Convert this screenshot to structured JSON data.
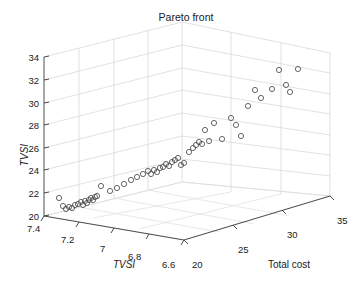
{
  "figure": {
    "title": "Pareto front",
    "background_color": "#ffffff",
    "marker_color": "#4d4d4d",
    "grid_color": "#d4d4d4",
    "axis_color": "#3a3a3a"
  },
  "chart_data": {
    "type": "scatter",
    "projection": "3d",
    "title": "Pareto front",
    "xlabel": "TVSI",
    "ylabel": "Total cost",
    "zlabel": "TVSI",
    "grid": true,
    "legend": null,
    "xlim": [
      7.4,
      6.6
    ],
    "ylim": [
      20,
      35
    ],
    "zlim": [
      20,
      34
    ],
    "xticks": [
      "7.4",
      "7.2",
      "7",
      "6.8",
      "6.6"
    ],
    "xtick_values": [
      7.4,
      7.2,
      7.0,
      6.8,
      6.6
    ],
    "yticks": [
      "20",
      "25",
      "30",
      "35"
    ],
    "ytick_values": [
      20,
      25,
      30,
      35
    ],
    "zticks": [
      "20",
      "22",
      "24",
      "26",
      "28",
      "30",
      "32",
      "34"
    ],
    "ztick_values": [
      20,
      22,
      24,
      26,
      28,
      30,
      32,
      34
    ],
    "n_points": 55,
    "marker": "circle-open",
    "points": [
      {
        "x": 7.37,
        "y": 20.3,
        "z": 21.8
      },
      {
        "x": 7.33,
        "y": 20.4,
        "z": 21.4
      },
      {
        "x": 7.32,
        "y": 20.5,
        "z": 21.0
      },
      {
        "x": 7.3,
        "y": 20.5,
        "z": 21.3
      },
      {
        "x": 7.29,
        "y": 20.6,
        "z": 21.2
      },
      {
        "x": 7.28,
        "y": 20.6,
        "z": 21.5
      },
      {
        "x": 7.27,
        "y": 20.7,
        "z": 21.7
      },
      {
        "x": 7.26,
        "y": 20.8,
        "z": 21.9
      },
      {
        "x": 7.25,
        "y": 20.8,
        "z": 21.6
      },
      {
        "x": 7.24,
        "y": 20.9,
        "z": 22.0
      },
      {
        "x": 7.23,
        "y": 20.9,
        "z": 21.8
      },
      {
        "x": 7.22,
        "y": 21.0,
        "z": 22.1
      },
      {
        "x": 7.21,
        "y": 21.0,
        "z": 22.2
      },
      {
        "x": 7.2,
        "y": 21.1,
        "z": 22.0
      },
      {
        "x": 7.19,
        "y": 21.2,
        "z": 22.3
      },
      {
        "x": 7.18,
        "y": 21.2,
        "z": 22.4
      },
      {
        "x": 7.17,
        "y": 21.4,
        "z": 23.2
      },
      {
        "x": 7.14,
        "y": 21.6,
        "z": 22.7
      },
      {
        "x": 7.12,
        "y": 21.8,
        "z": 23.0
      },
      {
        "x": 7.1,
        "y": 22.0,
        "z": 23.4
      },
      {
        "x": 7.08,
        "y": 22.2,
        "z": 23.7
      },
      {
        "x": 7.06,
        "y": 22.4,
        "z": 23.9
      },
      {
        "x": 7.04,
        "y": 22.6,
        "z": 24.2
      },
      {
        "x": 7.02,
        "y": 22.8,
        "z": 24.4
      },
      {
        "x": 7.01,
        "y": 22.9,
        "z": 24.1
      },
      {
        "x": 7.0,
        "y": 23.0,
        "z": 24.5
      },
      {
        "x": 6.99,
        "y": 23.1,
        "z": 24.3
      },
      {
        "x": 6.98,
        "y": 23.2,
        "z": 24.6
      },
      {
        "x": 6.97,
        "y": 23.3,
        "z": 24.7
      },
      {
        "x": 6.96,
        "y": 23.4,
        "z": 25.0
      },
      {
        "x": 6.95,
        "y": 23.5,
        "z": 24.8
      },
      {
        "x": 6.94,
        "y": 23.6,
        "z": 25.2
      },
      {
        "x": 6.93,
        "y": 23.7,
        "z": 25.4
      },
      {
        "x": 6.92,
        "y": 23.8,
        "z": 25.6
      },
      {
        "x": 6.91,
        "y": 23.9,
        "z": 24.9
      },
      {
        "x": 6.9,
        "y": 24.0,
        "z": 25.1
      },
      {
        "x": 6.89,
        "y": 24.2,
        "z": 26.1
      },
      {
        "x": 6.88,
        "y": 24.4,
        "z": 26.5
      },
      {
        "x": 6.87,
        "y": 24.5,
        "z": 26.8
      },
      {
        "x": 6.86,
        "y": 24.6,
        "z": 27.1
      },
      {
        "x": 6.85,
        "y": 24.7,
        "z": 26.9
      },
      {
        "x": 6.84,
        "y": 24.9,
        "z": 28.4
      },
      {
        "x": 6.83,
        "y": 25.1,
        "z": 27.2
      },
      {
        "x": 6.82,
        "y": 25.6,
        "z": 29.0
      },
      {
        "x": 6.8,
        "y": 26.2,
        "z": 27.3
      },
      {
        "x": 6.79,
        "y": 27.2,
        "z": 29.4
      },
      {
        "x": 6.78,
        "y": 27.6,
        "z": 28.7
      },
      {
        "x": 6.77,
        "y": 28.1,
        "z": 27.5
      },
      {
        "x": 6.76,
        "y": 28.9,
        "z": 30.0
      },
      {
        "x": 6.75,
        "y": 29.2,
        "z": 31.6
      },
      {
        "x": 6.74,
        "y": 29.7,
        "z": 30.9
      },
      {
        "x": 6.73,
        "y": 30.9,
        "z": 31.7
      },
      {
        "x": 6.72,
        "y": 31.6,
        "z": 33.5
      },
      {
        "x": 6.71,
        "y": 32.0,
        "z": 32.0
      },
      {
        "x": 6.7,
        "y": 32.3,
        "z": 31.3
      },
      {
        "x": 6.69,
        "y": 33.2,
        "z": 33.6
      }
    ]
  },
  "pixels": {
    "note": "precomputed screen positions of each marker center in figure pixels",
    "markers": [
      [
        59,
        198
      ],
      [
        63,
        206
      ],
      [
        66,
        209
      ],
      [
        69,
        207
      ],
      [
        72,
        208
      ],
      [
        75,
        205
      ],
      [
        78,
        204
      ],
      [
        81,
        202
      ],
      [
        83,
        205
      ],
      [
        85,
        201
      ],
      [
        87,
        203
      ],
      [
        89,
        200
      ],
      [
        91,
        198
      ],
      [
        93,
        200
      ],
      [
        95,
        197
      ],
      [
        97,
        196
      ],
      [
        101,
        186
      ],
      [
        110,
        191
      ],
      [
        117,
        188
      ],
      [
        124,
        184
      ],
      [
        131,
        180
      ],
      [
        137,
        177
      ],
      [
        143,
        174
      ],
      [
        148,
        171
      ],
      [
        151,
        174
      ],
      [
        154,
        170
      ],
      [
        157,
        172
      ],
      [
        160,
        168
      ],
      [
        163,
        167
      ],
      [
        166,
        164
      ],
      [
        169,
        166
      ],
      [
        172,
        162
      ],
      [
        175,
        160
      ],
      [
        178,
        158
      ],
      [
        181,
        165
      ],
      [
        184,
        163
      ],
      [
        189,
        152
      ],
      [
        193,
        148
      ],
      [
        196,
        145
      ],
      [
        199,
        142
      ],
      [
        202,
        144
      ],
      [
        205,
        130
      ],
      [
        209,
        141
      ],
      [
        214,
        123
      ],
      [
        222,
        139
      ],
      [
        231,
        118
      ],
      [
        236,
        125
      ],
      [
        241,
        136
      ],
      [
        248,
        106
      ],
      [
        255,
        90
      ],
      [
        261,
        98
      ],
      [
        272,
        89
      ],
      [
        279,
        70
      ],
      [
        286,
        85
      ],
      [
        290,
        92
      ],
      [
        298,
        69
      ]
    ]
  },
  "geometry": {
    "origin": [
      44,
      216
    ],
    "x_axis_end": [
      184,
      240
    ],
    "y_axis_end": [
      330,
      196
    ],
    "z_axis_top": [
      44,
      57
    ]
  }
}
